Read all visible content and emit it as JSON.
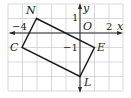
{
  "diagram": {
    "grid": {
      "origin_px": [
        80,
        33
      ],
      "unit_px": 14.5,
      "x_range": [
        -5,
        3
      ],
      "y_range": [
        -4,
        2
      ],
      "line_color": "#cfcfcf"
    },
    "axes": {
      "x_label": "x",
      "y_label": "y",
      "origin_label": "O"
    },
    "tick_labels": {
      "x_neg": "−4",
      "x_pos": "2",
      "y_pos": "1",
      "y_neg": "−1"
    },
    "polygon": {
      "name": "NELC",
      "vertices": [
        {
          "label": "N",
          "x": -3,
          "y": 1
        },
        {
          "label": "E",
          "x": 1,
          "y": -1
        },
        {
          "label": "L",
          "x": 0,
          "y": -3
        },
        {
          "label": "C",
          "x": -4,
          "y": -1
        }
      ],
      "stroke_color": "#1a1a1a"
    }
  }
}
